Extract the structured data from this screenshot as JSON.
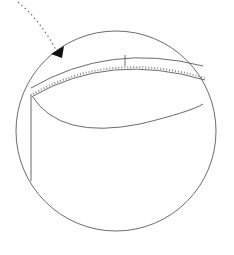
{
  "diagram": {
    "colors": {
      "stroke": "#6b6b6b",
      "arrow": "#111111",
      "background": "#ffffff"
    }
  }
}
